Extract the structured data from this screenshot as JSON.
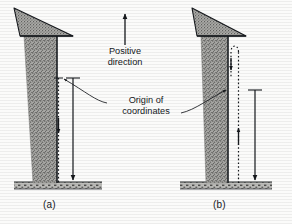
{
  "figure": {
    "background_color": "#fbfbfa",
    "ink_color": "#15181c",
    "labels": {
      "positive_direction": "Positive\ndirection",
      "origin_of_coordinates": "Origin of\ncoordinates",
      "panel_a": "(a)",
      "panel_b": "(b)"
    },
    "panels": [
      {
        "id": "a",
        "caption": "(a)",
        "tree": {
          "canopy_shape": "triangle",
          "trunk_shape": "tapered-vertical",
          "fill": "stippled-gray",
          "fill_color": "#9a9a98"
        },
        "axes": [
          {
            "name": "dashed-axis",
            "style": "dashed",
            "origin_position": "top",
            "arrow_direction": "down",
            "arrow_position": "mid",
            "tick_at_origin": "left-tick"
          },
          {
            "name": "solid-axis",
            "style": "solid",
            "origin_position": "top",
            "arrow_direction": "down",
            "arrow_position": "bottom",
            "tick_at_origin": "T-cap"
          }
        ],
        "ground": {
          "style": "hatched-bar",
          "color": "#8e8e8c"
        }
      },
      {
        "id": "b",
        "caption": "(b)",
        "tree": {
          "canopy_shape": "triangle",
          "trunk_shape": "tapered-vertical",
          "fill": "stippled-gray",
          "fill_color": "#9a9a98"
        },
        "axes": [
          {
            "name": "dashed-axis",
            "style": "dashed",
            "origin_position": "bottom",
            "arrow_direction": "up",
            "arrow_position": "mid",
            "hook_at_top": true,
            "tick_at_origin": "none"
          },
          {
            "name": "solid-axis",
            "style": "solid",
            "origin_position": "top",
            "arrow_direction": "down",
            "arrow_position": "bottom",
            "tick_at_origin": "T-cap"
          }
        ],
        "ground": {
          "style": "hatched-bar",
          "color": "#8e8e8c"
        }
      }
    ],
    "annotations": [
      {
        "name": "positive-direction-arrow",
        "text": "Positive\ndirection",
        "arrow_direction": "up",
        "arrow_style": "solid"
      },
      {
        "name": "origin-of-coordinates-leader",
        "text": "Origin of\ncoordinates",
        "points_to": [
          "panel-a-origin",
          "panel-b-origin"
        ],
        "arrow_style": "curved-leader"
      }
    ]
  }
}
